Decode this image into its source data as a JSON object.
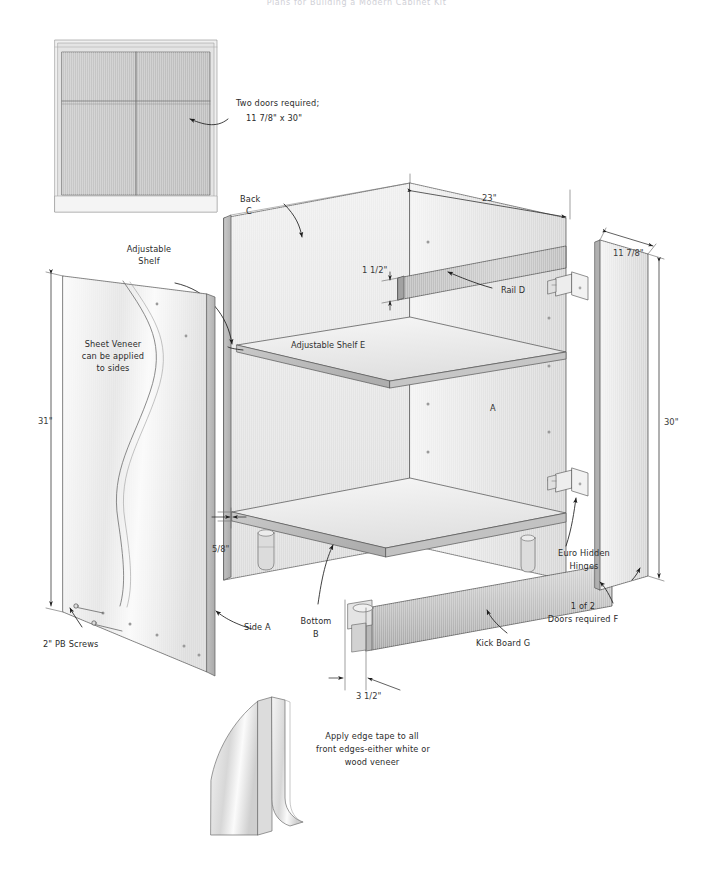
{
  "document": {
    "title": "Plans for Building a Modern Cabinet Kit",
    "background_color": "#ffffff",
    "line_color": "#4a4a4a",
    "panel_fill_light": "#e9e9e9",
    "panel_fill_mid": "#d2d2d2",
    "panel_fill_dark": "#b4b4b4"
  },
  "annotations": {
    "two_doors": "Two doors required;",
    "two_doors_size": "11 7/8\" x 30\"",
    "back_label": "Back",
    "back_letter": "C",
    "adjustable_shelf_line1": "Adjustable",
    "adjustable_shelf_line2": "Shelf",
    "sheet_veneer_line1": "Sheet Veneer",
    "sheet_veneer_line2": "can be applied",
    "sheet_veneer_line3": "to sides",
    "rail_d": "Rail D",
    "adjustable_shelf_e": "Adjustable Shelf E",
    "side_a_letter": "A",
    "pb_screws": "2\" PB Screws",
    "side_a": "Side A",
    "bottom_label": "Bottom",
    "bottom_letter": "B",
    "kick_board_g": "Kick Board G",
    "euro_hinges_line1": "Euro Hidden",
    "euro_hinges_line2": "Hinges",
    "doors_f_line1": "1 of 2",
    "doors_f_line2": "Doors required F",
    "edge_tape_line1": "Apply edge tape to all",
    "edge_tape_line2": "front edges-either white or",
    "edge_tape_line3": "wood veneer"
  },
  "dimensions": {
    "width_23": "23\"",
    "depth_11_78": "11 7/8\"",
    "rail_1_12": "1 1/2\"",
    "height_31": "31\"",
    "height_30": "30\"",
    "thickness_5_8": "5/8\"",
    "kick_3_12": "3 1/2\""
  },
  "parts_legend": [
    {
      "letter": "A",
      "name": "Side A"
    },
    {
      "letter": "B",
      "name": "Bottom B"
    },
    {
      "letter": "C",
      "name": "Back C"
    },
    {
      "letter": "D",
      "name": "Rail D"
    },
    {
      "letter": "E",
      "name": "Adjustable Shelf E"
    },
    {
      "letter": "F",
      "name": "Doors required F"
    },
    {
      "letter": "G",
      "name": "Kick Board G"
    }
  ]
}
